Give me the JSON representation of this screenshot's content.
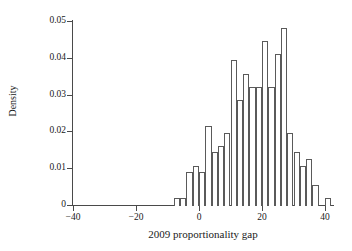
{
  "chart_data": {
    "type": "bar",
    "chart_subtype": "histogram",
    "title": "",
    "xlabel": "2009 proportionality gap",
    "ylabel": "Density",
    "xlim": [
      -44,
      44
    ],
    "ylim": [
      0,
      0.05
    ],
    "xticks": [
      -40,
      -20,
      0,
      20,
      40
    ],
    "xtick_labels": [
      "−40",
      "−20",
      "0",
      "20",
      "40"
    ],
    "yticks": [
      0,
      0.01,
      0.02,
      0.03,
      0.04,
      0.05
    ],
    "ytick_labels": [
      "0",
      "0.01",
      "0.02",
      "0.03",
      "0.04",
      "0.05"
    ],
    "grid": false,
    "legend": null,
    "bin_width": 2,
    "bar_fill": "#ffffff",
    "bar_edge_color": "#5a5a5a",
    "axis_color": "#4a4a4a",
    "bins": [
      {
        "x0": -8,
        "x1": -6,
        "center": -7,
        "value": 0.0018
      },
      {
        "x0": -6,
        "x1": -4,
        "center": -5,
        "value": 0.0018
      },
      {
        "x0": -4,
        "x1": -2,
        "center": -3,
        "value": 0.0089
      },
      {
        "x0": -2,
        "x1": 0,
        "center": -1,
        "value": 0.0107
      },
      {
        "x0": 0,
        "x1": 2,
        "center": 1,
        "value": 0.0089
      },
      {
        "x0": 2,
        "x1": 4,
        "center": 3,
        "value": 0.0214
      },
      {
        "x0": 4,
        "x1": 6,
        "center": 5,
        "value": 0.0143
      },
      {
        "x0": 6,
        "x1": 8,
        "center": 7,
        "value": 0.0161
      },
      {
        "x0": 8,
        "x1": 10,
        "center": 9,
        "value": 0.0196
      },
      {
        "x0": 10,
        "x1": 12,
        "center": 11,
        "value": 0.0393
      },
      {
        "x0": 12,
        "x1": 14,
        "center": 13,
        "value": 0.0286
      },
      {
        "x0": 14,
        "x1": 16,
        "center": 15,
        "value": 0.0357
      },
      {
        "x0": 16,
        "x1": 18,
        "center": 17,
        "value": 0.0321
      },
      {
        "x0": 18,
        "x1": 20,
        "center": 19,
        "value": 0.0321
      },
      {
        "x0": 20,
        "x1": 22,
        "center": 21,
        "value": 0.0446
      },
      {
        "x0": 22,
        "x1": 24,
        "center": 23,
        "value": 0.0321
      },
      {
        "x0": 24,
        "x1": 26,
        "center": 25,
        "value": 0.0411
      },
      {
        "x0": 26,
        "x1": 28,
        "center": 27,
        "value": 0.0482
      },
      {
        "x0": 28,
        "x1": 30,
        "center": 29,
        "value": 0.0196
      },
      {
        "x0": 30,
        "x1": 32,
        "center": 31,
        "value": 0.0143
      },
      {
        "x0": 32,
        "x1": 34,
        "center": 33,
        "value": 0.0107
      },
      {
        "x0": 34,
        "x1": 36,
        "center": 35,
        "value": 0.0125
      },
      {
        "x0": 36,
        "x1": 38,
        "center": 37,
        "value": 0.0054
      },
      {
        "x0": 40,
        "x1": 42,
        "center": 41,
        "value": 0.0018
      }
    ]
  }
}
